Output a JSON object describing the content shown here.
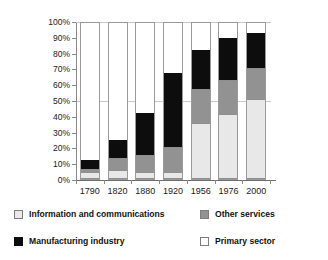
{
  "chart_data": {
    "type": "bar",
    "subtype": "stacked-100-percent",
    "title": "",
    "xlabel": "",
    "ylabel": "",
    "ylim": [
      0,
      100
    ],
    "ytick_labels": [
      "0%",
      "10%",
      "20%",
      "30%",
      "40%",
      "50%",
      "60%",
      "70%",
      "80%",
      "90%",
      "100%"
    ],
    "ytick_values": [
      0,
      10,
      20,
      30,
      40,
      50,
      60,
      70,
      80,
      90,
      100
    ],
    "grid": "horizontal-light",
    "legend_position": "bottom",
    "categories": [
      "1790",
      "1820",
      "1880",
      "1920",
      "1956",
      "1976",
      "2000"
    ],
    "series": [
      {
        "name": "Information and communications",
        "color": "#e8e8e8",
        "values": [
          4,
          5,
          4,
          4,
          35,
          41,
          50.5
        ]
      },
      {
        "name": "Other services",
        "color": "#929292",
        "values": [
          2,
          8,
          11,
          16,
          22,
          22,
          20
        ]
      },
      {
        "name": "Manufacturing industry",
        "color": "#0d0d0d",
        "values": [
          6,
          12,
          27,
          48,
          26,
          27.5,
          23
        ]
      },
      {
        "name": "Primary sector",
        "color": "#ffffff",
        "values": [
          88,
          75,
          58,
          32,
          17,
          9.5,
          6.5
        ]
      }
    ],
    "cumulative_tops": {
      "1790": [
        4,
        6,
        12,
        100
      ],
      "1820": [
        5,
        13,
        25,
        100
      ],
      "1880": [
        4,
        15,
        42,
        100
      ],
      "1920": [
        4,
        20,
        68,
        100
      ],
      "1956": [
        35,
        57,
        83,
        100
      ],
      "1976": [
        41,
        63,
        90.5,
        100
      ],
      "2000": [
        50.5,
        70.5,
        93.5,
        100
      ]
    }
  },
  "legend": {
    "items": [
      {
        "label": "Information and communications",
        "swatch": "info"
      },
      {
        "label": "Manufacturing industry",
        "swatch": "manu"
      },
      {
        "label": "Other services",
        "swatch": "other"
      },
      {
        "label": "Primary sector",
        "swatch": "primary"
      }
    ]
  }
}
